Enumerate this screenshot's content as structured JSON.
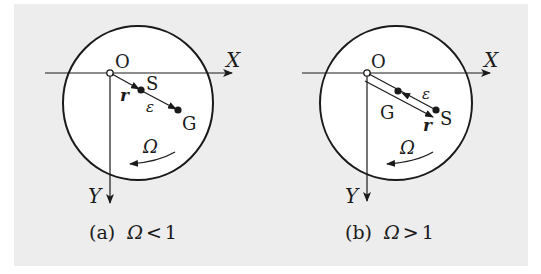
{
  "figure": {
    "background_color": "#ededed",
    "line_color": "#1a1a1a",
    "panels": [
      {
        "id": "a",
        "caption_prefix": "(a)",
        "caption_condition": "Ω < 1",
        "caption_symbol": "Ω",
        "caption_relation": "<",
        "caption_value": "1",
        "labels": {
          "origin": "O",
          "x_axis": "X",
          "y_axis": "Y",
          "point_s": "S",
          "point_g": "G",
          "vector_r": "r",
          "vector_eps": "ε",
          "rotation": "Ω"
        },
        "order_along_ray": [
          "O",
          "S",
          "G"
        ]
      },
      {
        "id": "b",
        "caption_prefix": "(b)",
        "caption_condition": "Ω > 1",
        "caption_symbol": "Ω",
        "caption_relation": ">",
        "caption_value": "1",
        "labels": {
          "origin": "O",
          "x_axis": "X",
          "y_axis": "Y",
          "point_s": "S",
          "point_g": "G",
          "vector_r": "r",
          "vector_eps": "ε",
          "rotation": "Ω"
        },
        "order_along_ray": [
          "O",
          "G",
          "S"
        ]
      }
    ]
  }
}
